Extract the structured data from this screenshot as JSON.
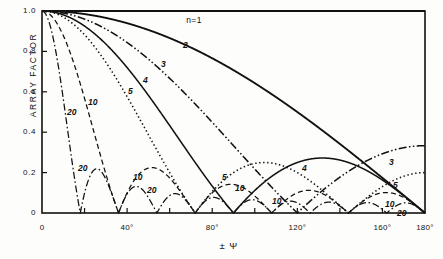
{
  "figure": {
    "background": "#fdfdfb",
    "ink": "#111111"
  },
  "axes": {
    "y_title": "ARRAY FACTOR",
    "x_title": "± Ψ",
    "y_ticks": [
      "1.0",
      "0.8",
      "0.6",
      "0.4",
      "0.2",
      "0"
    ],
    "y_tick_values": [
      1.0,
      0.8,
      0.6,
      0.4,
      0.2,
      0.0
    ],
    "x_ticks": [
      "0",
      "40°",
      "80°",
      "120°",
      "160°",
      "180°"
    ],
    "x_tick_values": [
      0,
      40,
      80,
      120,
      160,
      180
    ],
    "x_minor_values": [
      20,
      60,
      100,
      140
    ],
    "xlim": [
      0,
      180
    ],
    "ylim": [
      0,
      1.0
    ],
    "grid": false
  },
  "annotations": [
    {
      "text": "n=1",
      "x": 72,
      "y": 0.955,
      "name": "annotation-n1"
    }
  ],
  "curve_labels": [
    {
      "text": "2",
      "px": 183,
      "py": 40,
      "name": "curve-label-2"
    },
    {
      "text": "3",
      "px": 161,
      "py": 59,
      "name": "curve-label-3"
    },
    {
      "text": "4",
      "px": 143,
      "py": 75,
      "name": "curve-label-4"
    },
    {
      "text": "5",
      "px": 128,
      "py": 86,
      "name": "curve-label-5"
    },
    {
      "text": "10",
      "px": 88,
      "py": 97,
      "name": "curve-label-10"
    },
    {
      "text": "20",
      "px": 67,
      "py": 107,
      "name": "curve-label-20"
    },
    {
      "text": "20",
      "px": 78,
      "py": 163,
      "name": "curve-label-20-lobe1"
    },
    {
      "text": "10",
      "px": 133,
      "py": 172,
      "name": "curve-label-10-lobe1"
    },
    {
      "text": "20",
      "px": 147,
      "py": 185,
      "name": "curve-label-20-lobe2"
    },
    {
      "text": "5",
      "px": 222,
      "py": 172,
      "name": "curve-label-5-lobe"
    },
    {
      "text": "10",
      "px": 235,
      "py": 183,
      "name": "curve-label-10-lobe2"
    },
    {
      "text": "4",
      "px": 302,
      "py": 163,
      "name": "curve-label-4-lobe"
    },
    {
      "text": "10",
      "px": 272,
      "py": 196,
      "name": "curve-label-10-lobe3"
    },
    {
      "text": "3",
      "px": 389,
      "py": 157,
      "name": "curve-label-3-right"
    },
    {
      "text": "5",
      "px": 393,
      "py": 180,
      "name": "curve-label-5-right"
    },
    {
      "text": "10",
      "px": 385,
      "py": 199,
      "name": "curve-label-10-right"
    },
    {
      "text": "20",
      "px": 397,
      "py": 208,
      "name": "curve-label-20-right"
    }
  ],
  "chart_data": {
    "type": "line",
    "title": "",
    "subtitle": "",
    "xlabel": "± Ψ",
    "ylabel": "ARRAY FACTOR",
    "xlim": [
      0,
      180
    ],
    "ylim": [
      0,
      1.0
    ],
    "grid": false,
    "legend_position": "inline-curve-labels",
    "annotation": "n=1",
    "formula": "AF = |sin(n*psi/2) / (n*sin(psi/2))|",
    "x_unit": "degrees",
    "series": [
      {
        "name": "n=1",
        "n": 1,
        "style": "solid",
        "color": "#111111",
        "description": "uniform, constant at 1.0 across full range",
        "nulls_deg": [],
        "sidelobe_peaks": [],
        "value_at_180": 1.0
      },
      {
        "name": "2",
        "n": 2,
        "style": "solid",
        "color": "#111111",
        "description": "two-element array, monotonic decrease to zero at 180 deg",
        "nulls_deg": [
          180
        ],
        "sidelobe_peaks": [],
        "value_at_180": 0.0
      },
      {
        "name": "3",
        "n": 3,
        "style": "dashdotdot",
        "color": "#111111",
        "description": "null near 120 deg, rises to 0.29 at 180 deg",
        "nulls_deg": [
          120
        ],
        "sidelobe_peaks": [
          {
            "x": 180,
            "y": 0.29
          }
        ],
        "value_at_180": 0.33
      },
      {
        "name": "4",
        "n": 4,
        "style": "solid",
        "color": "#111111",
        "description": "nulls at 90 and 180 deg, sidelobe peak ~0.21 near 120 deg",
        "nulls_deg": [
          90,
          180
        ],
        "sidelobe_peaks": [
          {
            "x": 123,
            "y": 0.215
          }
        ],
        "value_at_180": 0.0
      },
      {
        "name": "5",
        "n": 5,
        "style": "dotted",
        "color": "#111111",
        "description": "nulls at 72 and 144 deg, sidelobes ~0.20 and rises to 0.15 at 180",
        "nulls_deg": [
          72,
          144
        ],
        "sidelobe_peaks": [
          {
            "x": 99,
            "y": 0.2
          },
          {
            "x": 180,
            "y": 0.15
          }
        ],
        "value_at_180": 0.2
      },
      {
        "name": "10",
        "n": 10,
        "style": "dashed",
        "color": "#111111",
        "description": "nulls every 36 deg, sidelobes ~0.21, 0.13, 0.09, 0.08, 0.10",
        "nulls_deg": [
          36,
          72,
          108,
          144,
          180
        ],
        "sidelobe_peaks": [
          {
            "x": 54,
            "y": 0.215
          },
          {
            "x": 90,
            "y": 0.13
          },
          {
            "x": 126,
            "y": 0.09
          },
          {
            "x": 162,
            "y": 0.095
          }
        ],
        "value_at_180": 0.0
      },
      {
        "name": "20",
        "n": 20,
        "style": "dashdot",
        "color": "#111111",
        "description": "nulls every 18 deg, first sidelobe ~0.21 at 27 deg, then ~0.07 each",
        "nulls_deg": [
          18,
          36,
          54,
          72,
          90,
          108,
          126,
          144,
          162,
          180
        ],
        "sidelobe_peaks": [
          {
            "x": 27,
            "y": 0.215
          },
          {
            "x": 45,
            "y": 0.13
          },
          {
            "x": 63,
            "y": 0.09
          },
          {
            "x": 81,
            "y": 0.075
          },
          {
            "x": 99,
            "y": 0.068
          },
          {
            "x": 117,
            "y": 0.065
          },
          {
            "x": 135,
            "y": 0.068
          },
          {
            "x": 153,
            "y": 0.075
          },
          {
            "x": 171,
            "y": 0.09
          }
        ],
        "value_at_180": 0.0
      }
    ]
  }
}
